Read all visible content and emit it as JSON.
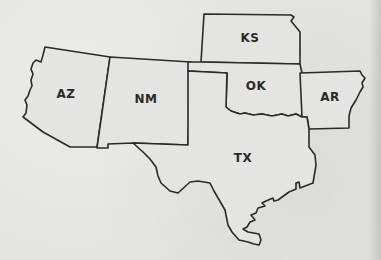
{
  "map": {
    "title": "",
    "states": [
      {
        "abbr": "AZ",
        "label_x": 66,
        "label_y": 94
      },
      {
        "abbr": "NM",
        "label_x": 146,
        "label_y": 99
      },
      {
        "abbr": "KS",
        "label_x": 250,
        "label_y": 38
      },
      {
        "abbr": "OK",
        "label_x": 256,
        "label_y": 86
      },
      {
        "abbr": "AR",
        "label_x": 330,
        "label_y": 97
      },
      {
        "abbr": "TX",
        "label_x": 243,
        "label_y": 158
      }
    ],
    "colors": {
      "background": "#e4e4e2",
      "stroke": "#2a2a2a",
      "label": "#2a2a2a"
    }
  }
}
